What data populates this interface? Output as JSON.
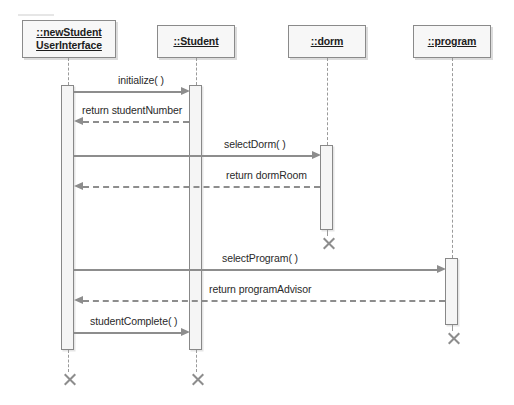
{
  "diagram": {
    "type": "uml-sequence-diagram",
    "background_color": "#ffffff",
    "line_color": "#8d8d8d",
    "box_fill_color": "#f7f7f7",
    "box_border_color": "#8a8a8a",
    "text_color": "#1d1d1d"
  },
  "lifelines": [
    {
      "id": "ui",
      "name_lines": [
        "::newStudent",
        "UserInterface"
      ],
      "box": {
        "x": 22,
        "y": 20,
        "width": 94,
        "height": 38
      },
      "center_x": 68,
      "activation": {
        "x": 61,
        "y": 85,
        "width": 13,
        "height": 265
      },
      "termination_x_mark": {
        "x": 61,
        "y": 372
      }
    },
    {
      "id": "student",
      "name_lines": [
        "::Student"
      ],
      "box": {
        "x": 157,
        "y": 25,
        "width": 78,
        "height": 33
      },
      "center_x": 196,
      "activation": {
        "x": 189,
        "y": 85,
        "width": 13,
        "height": 265
      },
      "termination_x_mark": {
        "x": 189,
        "y": 372
      }
    },
    {
      "id": "dorm",
      "name_lines": [
        "::dorm"
      ],
      "box": {
        "x": 288,
        "y": 25,
        "width": 78,
        "height": 33
      },
      "center_x": 327,
      "activation": {
        "x": 320,
        "y": 145,
        "width": 13,
        "height": 85
      },
      "termination_x_mark": {
        "x": 320,
        "y": 236
      }
    },
    {
      "id": "program",
      "name_lines": [
        "::program"
      ],
      "box": {
        "x": 413,
        "y": 25,
        "width": 78,
        "height": 33
      },
      "center_x": 452,
      "activation": {
        "x": 445,
        "y": 258,
        "width": 13,
        "height": 67
      },
      "termination_x_mark": {
        "x": 445,
        "y": 331
      }
    }
  ],
  "messages": [
    {
      "label": "initialize( )",
      "from": "ui",
      "to": "student",
      "direction": "right",
      "style": "solid",
      "y": 91,
      "label_x": 118,
      "label_y": 74
    },
    {
      "label": "return studentNumber",
      "from": "student",
      "to": "ui",
      "direction": "left",
      "style": "dashed",
      "y": 121,
      "label_x": 82,
      "label_y": 104
    },
    {
      "label": "selectDorm( )",
      "from": "ui",
      "to": "dorm",
      "direction": "right",
      "style": "solid",
      "y": 155,
      "label_x": 224,
      "label_y": 138
    },
    {
      "label": "return dormRoom",
      "from": "dorm",
      "to": "ui",
      "direction": "left",
      "style": "dashed",
      "y": 186,
      "label_x": 226,
      "label_y": 169
    },
    {
      "label": "selectProgram( )",
      "from": "ui",
      "to": "program",
      "direction": "right",
      "style": "solid",
      "y": 269,
      "label_x": 222,
      "label_y": 252
    },
    {
      "label": "return programAdvisor",
      "from": "program",
      "to": "ui",
      "direction": "left",
      "style": "dashed",
      "y": 300,
      "label_x": 209,
      "label_y": 283
    },
    {
      "label": "studentComplete( )",
      "from": "ui",
      "to": "student",
      "direction": "right",
      "style": "solid",
      "y": 332,
      "label_x": 90,
      "label_y": 315
    }
  ]
}
